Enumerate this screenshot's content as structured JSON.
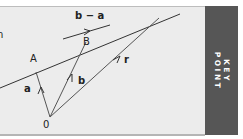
{
  "diagram": {
    "points": [
      {
        "id": "O",
        "label": "0",
        "x": 50,
        "y": 117
      },
      {
        "id": "A",
        "label": "A",
        "x": 36,
        "y": 72
      },
      {
        "id": "B",
        "label": "B",
        "x": 86,
        "y": 42
      }
    ],
    "vectors": [
      {
        "name": "a",
        "from": "O",
        "to": "A",
        "label": "a"
      },
      {
        "name": "b",
        "from": "O",
        "to": "B",
        "label": "b"
      },
      {
        "name": "r",
        "from": "O",
        "to": "R",
        "label": "r"
      },
      {
        "name": "b-a",
        "label": "b − a"
      }
    ],
    "line": {
      "through": [
        "A",
        "B"
      ]
    },
    "labels": {
      "origin": "0",
      "point_a": "A",
      "point_b": "B",
      "vector_a": "a",
      "vector_b": "b",
      "vector_r": "r",
      "vector_b_minus_a": "b − a",
      "cut_text": "n"
    },
    "colors": {
      "panel_bg": "#ececec",
      "line": "#333333",
      "key_strip": "#565656",
      "key_text": "#ffffff"
    }
  },
  "key_point": {
    "line1": "KEY",
    "line2": "POINT"
  }
}
